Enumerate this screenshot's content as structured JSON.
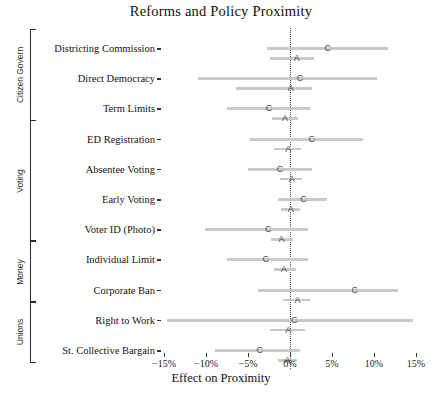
{
  "chart_data": {
    "type": "scatter",
    "title": "Reforms and Policy Proximity",
    "xlabel": "Effect on Proximity",
    "ylabel": "",
    "xlim": [
      -17.5,
      16.5
    ],
    "xticks": [
      -15,
      -10,
      -5,
      0,
      5,
      10,
      15
    ],
    "xticklabels": [
      "−15%",
      "−10%",
      "−5%",
      "0%",
      "5%",
      "10%",
      "15%"
    ],
    "grid": false,
    "legend": "none",
    "reference_line": {
      "x": 0,
      "style": "dotted"
    },
    "series": [
      {
        "name": "C",
        "marker_label": "C",
        "description": "Citizen estimate"
      },
      {
        "name": "A",
        "marker_label": "A",
        "description": "Alternative estimate"
      }
    ],
    "groups": [
      {
        "label": "Citizen Govern",
        "rows": [
          {
            "label": "Districting Commission",
            "estimates": [
              {
                "series": "C",
                "value": 4.5,
                "ci_low": -2.7,
                "ci_high": 11.7
              },
              {
                "series": "A",
                "value": 0.8,
                "ci_low": -2.4,
                "ci_high": 2.9
              }
            ]
          },
          {
            "label": "Direct Democracy",
            "estimates": [
              {
                "series": "C",
                "value": 1.2,
                "ci_low": -11.0,
                "ci_high": 10.4
              },
              {
                "series": "A",
                "value": 0.1,
                "ci_low": -6.4,
                "ci_high": 2.6
              }
            ]
          },
          {
            "label": "Term Limits",
            "estimates": [
              {
                "series": "C",
                "value": -2.5,
                "ci_low": -7.5,
                "ci_high": 2.4
              },
              {
                "series": "A",
                "value": -0.6,
                "ci_low": -2.1,
                "ci_high": 1.0
              }
            ]
          }
        ]
      },
      {
        "label": "Voting",
        "rows": [
          {
            "label": "ED Registration",
            "estimates": [
              {
                "series": "C",
                "value": 2.6,
                "ci_low": -4.8,
                "ci_high": 8.7
              },
              {
                "series": "A",
                "value": -0.2,
                "ci_low": -1.9,
                "ci_high": 1.3
              }
            ]
          },
          {
            "label": "Absentee Voting",
            "estimates": [
              {
                "series": "C",
                "value": -1.2,
                "ci_low": -5.0,
                "ci_high": 2.6
              },
              {
                "series": "A",
                "value": 0.2,
                "ci_low": -1.2,
                "ci_high": 1.4
              }
            ]
          },
          {
            "label": "Early Voting",
            "estimates": [
              {
                "series": "C",
                "value": 1.6,
                "ci_low": -1.4,
                "ci_high": 4.4
              },
              {
                "series": "A",
                "value": 0.1,
                "ci_low": -1.1,
                "ci_high": 1.2
              }
            ]
          },
          {
            "label": "Voter ID (Photo)",
            "estimates": [
              {
                "series": "C",
                "value": -2.6,
                "ci_low": -10.1,
                "ci_high": 2.1
              },
              {
                "series": "A",
                "value": -1.0,
                "ci_low": -2.3,
                "ci_high": 0.4
              }
            ]
          }
        ]
      },
      {
        "label": "Money",
        "rows": [
          {
            "label": "Individual Limit",
            "estimates": [
              {
                "series": "C",
                "value": -2.9,
                "ci_low": -7.5,
                "ci_high": 2.1
              },
              {
                "series": "A",
                "value": -0.7,
                "ci_low": -1.9,
                "ci_high": 0.7
              }
            ]
          },
          {
            "label": "Corporate Ban",
            "estimates": [
              {
                "series": "C",
                "value": 7.7,
                "ci_low": -3.8,
                "ci_high": 12.9
              },
              {
                "series": "A",
                "value": 0.9,
                "ci_low": -0.8,
                "ci_high": 2.4
              }
            ]
          }
        ]
      },
      {
        "label": "Unions",
        "rows": [
          {
            "label": "Right to Work",
            "estimates": [
              {
                "series": "C",
                "value": 0.5,
                "ci_low": -14.6,
                "ci_high": 14.6
              },
              {
                "series": "A",
                "value": -0.2,
                "ci_low": -2.4,
                "ci_high": 1.8
              }
            ]
          },
          {
            "label": "St. Collective Bargain",
            "estimates": [
              {
                "series": "C",
                "value": -3.6,
                "ci_low": -8.9,
                "ci_high": 1.2
              },
              {
                "series": "A",
                "value": -0.3,
                "ci_low": -1.4,
                "ci_high": 0.8
              }
            ]
          }
        ]
      }
    ]
  },
  "style": {
    "bar_color": "#c9c9c9",
    "marker_color": "#4a4a4a",
    "axis_color": "#333333",
    "text_color": "#111111"
  }
}
